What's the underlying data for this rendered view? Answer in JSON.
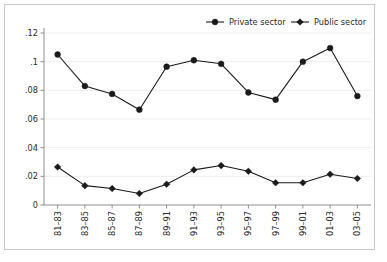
{
  "chart_data": {
    "type": "line",
    "title": "",
    "subtitle": "",
    "xlabel": "",
    "ylabel": "",
    "grid": true,
    "legend_position": "top-right",
    "categories": [
      "81–83",
      "83–85",
      "85–87",
      "87–89",
      "89–91",
      "91–93",
      "93–95",
      "95–97",
      "97–99",
      "99–01",
      "01–03",
      "03–05"
    ],
    "ylim": [
      0,
      0.12
    ],
    "yticks": [
      0,
      0.02,
      0.04,
      0.06,
      0.08,
      0.1,
      0.12
    ],
    "ytick_labels": [
      "0",
      ".02",
      ".04",
      ".06",
      ".08",
      ".1",
      ".12"
    ],
    "series": [
      {
        "name": "Private sector",
        "marker": "circle",
        "color": "#1a1a1a",
        "values": [
          0.105,
          0.083,
          0.0775,
          0.0665,
          0.0965,
          0.101,
          0.0985,
          0.0785,
          0.0735,
          0.1,
          0.1095,
          0.076
        ]
      },
      {
        "name": "Public sector",
        "marker": "diamond",
        "color": "#1a1a1a",
        "values": [
          0.0265,
          0.0135,
          0.0115,
          0.008,
          0.0145,
          0.0245,
          0.0275,
          0.0235,
          0.0155,
          0.0155,
          0.0215,
          0.0185
        ]
      }
    ]
  },
  "legend": {
    "items": [
      {
        "label": "Private sector",
        "marker": "circle"
      },
      {
        "label": "Public sector",
        "marker": "diamond"
      }
    ]
  },
  "colors": {
    "series": "#1a1a1a",
    "grid": "#f0eeea",
    "axis": "#8f8f8f",
    "frame": "#c9c9c9",
    "background": "#ffffff",
    "text": "#2b2b2b"
  }
}
